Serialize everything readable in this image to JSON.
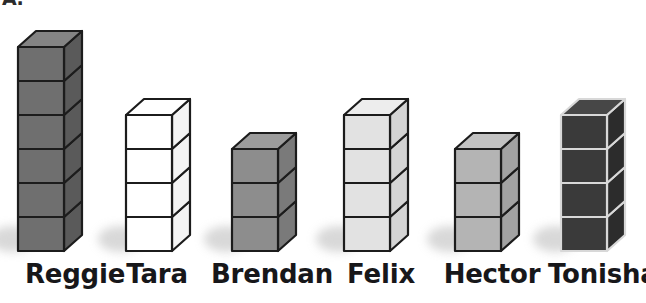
{
  "image": {
    "kind": "pictograph-cube-tower-chart",
    "background_color": "#ffffff",
    "clipped_heading_fragment": "A."
  },
  "chart_data": {
    "type": "bar",
    "title": "",
    "subtitle": "",
    "xlabel": "",
    "ylabel": "",
    "unit": "cubes",
    "categories": [
      "Reggie",
      "Tara",
      "Brendan",
      "Felix",
      "Hector",
      "Tonisha"
    ],
    "values": [
      6,
      4,
      3,
      4,
      3,
      4
    ],
    "ylim": [
      0,
      6
    ],
    "grid": false,
    "legend": false,
    "orientation": "vertical",
    "note": "Each bar is a stack of 3D isometric cubes; bar height equals the cube count.",
    "series": [
      {
        "name": "Number of cubes",
        "values": [
          6,
          4,
          3,
          4,
          3,
          4
        ]
      }
    ]
  },
  "towers": [
    {
      "name": "Reggie",
      "label": "Reggie",
      "cubes": 6,
      "front_color": "#6f6f6f",
      "side_color": "#5a5a5a",
      "top_color": "#848484",
      "edge_color": "#1c1c1c",
      "x": 18,
      "label_x": 0,
      "label_width": 150
    },
    {
      "name": "Tara",
      "label": "Tara",
      "cubes": 4,
      "front_color": "#ffffff",
      "side_color": "#f4f4f4",
      "top_color": "#ffffff",
      "edge_color": "#1c1c1c",
      "x": 126,
      "label_x": 108,
      "label_width": 98
    },
    {
      "name": "Brendan",
      "label": "Brendan",
      "cubes": 3,
      "front_color": "#8d8d8d",
      "side_color": "#7a7a7a",
      "top_color": "#9c9c9c",
      "edge_color": "#1c1c1c",
      "x": 232,
      "label_x": 196,
      "label_width": 152
    },
    {
      "name": "Felix",
      "label": "Felix",
      "cubes": 4,
      "front_color": "#e2e2e2",
      "side_color": "#d4d4d4",
      "top_color": "#ededed",
      "edge_color": "#1c1c1c",
      "x": 344,
      "label_x": 330,
      "label_width": 102
    },
    {
      "name": "Hector",
      "label": "Hector",
      "cubes": 3,
      "front_color": "#b4b4b4",
      "side_color": "#a2a2a2",
      "top_color": "#c2c2c2",
      "edge_color": "#1c1c1c",
      "x": 455,
      "label_x": 424,
      "label_width": 136
    },
    {
      "name": "Tonisha",
      "label": "Tonisha",
      "cubes": 4,
      "front_color": "#3a3a3a",
      "side_color": "#2c2c2c",
      "top_color": "#474747",
      "edge_color": "#d8d8d8",
      "x": 561,
      "label_x": 548,
      "label_width": 98
    }
  ],
  "geometry": {
    "baseline_y": 251,
    "cube_width": 46,
    "cube_height": 34,
    "depth_x": 18,
    "depth_y": 16
  }
}
